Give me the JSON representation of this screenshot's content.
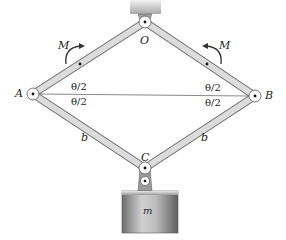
{
  "diagram": {
    "type": "mechanism",
    "points": {
      "O": {
        "label": "O",
        "x": 145,
        "y": 22
      },
      "A": {
        "label": "A",
        "x": 33,
        "y": 94
      },
      "B": {
        "label": "B",
        "x": 255,
        "y": 96
      },
      "C": {
        "label": "C",
        "x": 145,
        "y": 168
      }
    },
    "moments": [
      {
        "label": "M",
        "on": "OA",
        "direction": "clockwise"
      },
      {
        "label": "M",
        "on": "OB",
        "direction": "counterclockwise"
      }
    ],
    "angles": {
      "A_upper": "θ/2",
      "A_lower": "θ/2",
      "B_upper": "θ/2",
      "B_lower": "θ/2"
    },
    "lengths": {
      "AC": "b",
      "BC": "b"
    },
    "mass": {
      "label": "m"
    },
    "colors": {
      "bar_fill": "#d9d9d9",
      "bar_stroke": "#7a7a7a",
      "ceiling": "#bdbdbd",
      "mass_fill": "#8f8f8f",
      "text": "#222222"
    }
  }
}
